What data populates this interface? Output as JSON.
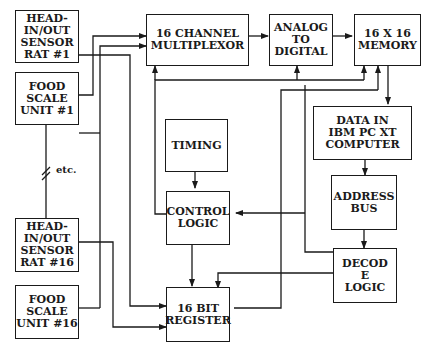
{
  "diagram": {
    "blocks": {
      "sensor1": "HEAD-\nIN/OUT\nSENSOR\nRAT #1",
      "scale1": "FOOD\nSCALE\nUNIT #1",
      "sensor16": "HEAD-\nIN/OUT\nSENSOR\nRAT #16",
      "scale16": "FOOD\nSCALE\nUNIT #16",
      "mux": "16 CHANNEL\nMULTIPLEXOR",
      "adc": "ANALOG\nTO\nDIGITAL",
      "memory": "16 X 16\nMEMORY",
      "pc": "DATA IN\nIBM PC XT\nCOMPUTER",
      "timing": "TIMING",
      "control": "CONTROL\nLOGIC",
      "address": "ADDRESS\nBUS",
      "decode": "DECOD\nE\nLOGIC",
      "register": "16 BIT\nREGISTER"
    },
    "annotations": {
      "etc": "etc."
    },
    "colors": {
      "line": "#1a1a1a",
      "background": "#ffffff"
    }
  }
}
